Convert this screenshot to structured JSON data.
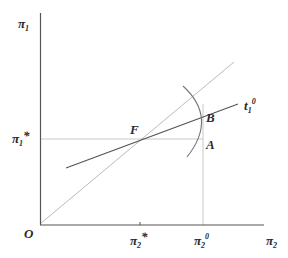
{
  "diagram": {
    "type": "economics-graph",
    "axes": {
      "y_label": "π",
      "y_label_sub": "1",
      "x_label": "π",
      "x_label_sub": "2",
      "origin_label": "O"
    },
    "ticks": {
      "y_star_label": "π",
      "y_star_sub": "1",
      "y_star_sup": "*",
      "x_star_label": "π",
      "x_star_sub": "2",
      "x_star_sup": "*",
      "x_zero_label": "π",
      "x_zero_sub": "2",
      "x_zero_sup": "0"
    },
    "points": {
      "F": "F",
      "B": "B",
      "A": "A"
    },
    "curves": {
      "t_label": "t",
      "t_sub": "1",
      "t_sup": "0"
    },
    "colors": {
      "axis": "#555555",
      "diagonal": "#bbbbbb",
      "t_line": "#555555",
      "arc": "#777777",
      "guide": "#c8c8c8",
      "text": "#2a2a2a"
    }
  }
}
